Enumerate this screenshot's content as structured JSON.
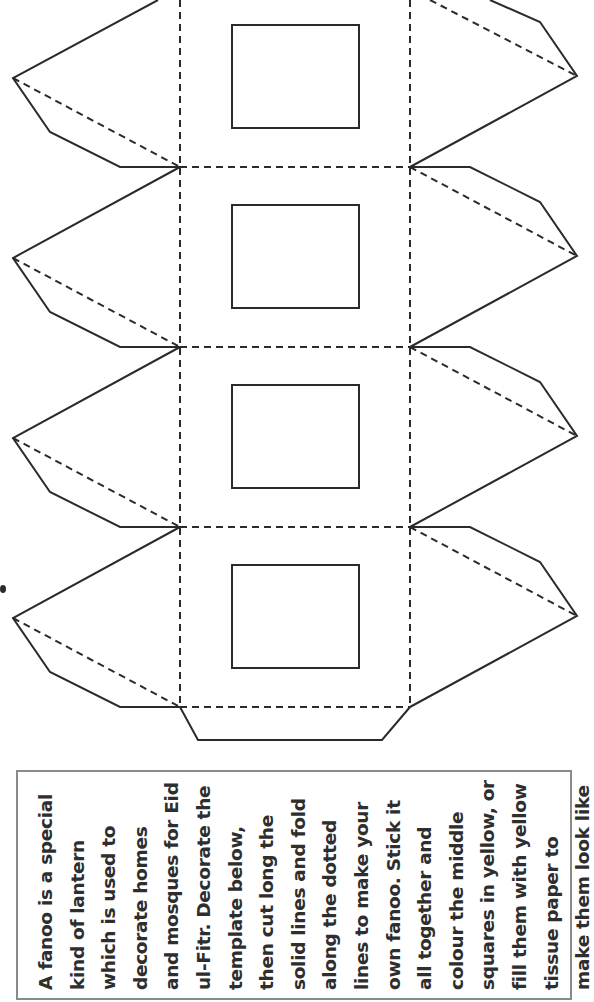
{
  "template": {
    "name": "fanoo lantern template",
    "colors": {
      "line": "#2b2b2b",
      "box_border": "#8a8a8a",
      "text": "#2e2e2e",
      "background": "#ffffff"
    },
    "panels": 4,
    "legend": {
      "solid_lines": "cut",
      "dotted_lines": "fold"
    }
  },
  "instructions": {
    "lines": [
      "A fanoo is a special",
      "kind of lantern",
      "which is used to",
      "decorate homes",
      "and mosques for Eid",
      "ul-Fitr. Decorate the",
      "template below,",
      "then cut long the",
      "solid lines and fold",
      "along the dotted",
      "lines to make your",
      "own fanoo. Stick it",
      "all together and",
      "colour the middle",
      "squares in yellow, or",
      "fill them with yellow",
      "tissue paper to",
      "make them look like",
      "they are glowing."
    ]
  }
}
